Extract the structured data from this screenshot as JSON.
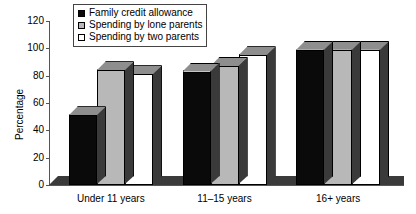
{
  "chart_data": {
    "type": "bar",
    "title": "",
    "xlabel": "",
    "ylabel": "Percentage",
    "categories": [
      "Under 11 years",
      "11–15 years",
      "16+ years"
    ],
    "ylim": [
      0,
      120
    ],
    "yticks": [
      0,
      20,
      40,
      60,
      80,
      100,
      120
    ],
    "grid": false,
    "legend_position": "top-center",
    "series": [
      {
        "name": "Family credit allowance",
        "color": "#0a0a0a",
        "values": [
          51,
          83,
          99
        ]
      },
      {
        "name": "Spending by lone parents",
        "color": "#b8b8b8",
        "values": [
          84,
          87,
          99
        ]
      },
      {
        "name": "Spending by two parents",
        "color": "#ffffff",
        "values": [
          81,
          95,
          99
        ]
      }
    ]
  },
  "colors": {
    "axis": "#555555",
    "text": "#000000",
    "background": "#ffffff",
    "bar_black": "#0a0a0a",
    "bar_gray": "#b8b8b8",
    "bar_white": "#ffffff",
    "shade_dark": "#3a3a3a",
    "shade_mid": "#8e8e8e"
  }
}
